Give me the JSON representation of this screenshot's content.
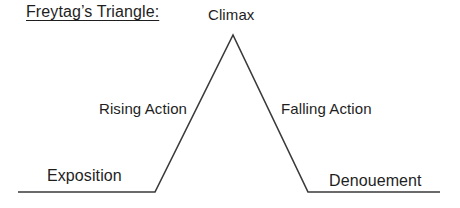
{
  "title": "Freytag’s Triangle:",
  "labels": {
    "climax": "Climax",
    "rising_action": "Rising Action",
    "falling_action": "Falling Action",
    "exposition": "Exposition",
    "denouement": "Denouement"
  },
  "colors": {
    "line": "#3a3a3a",
    "text": "#1e1e1e",
    "background": "#ffffff"
  }
}
